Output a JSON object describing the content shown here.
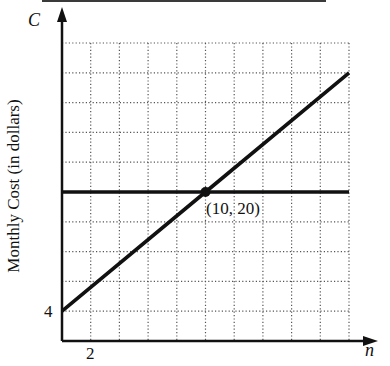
{
  "chart_data": {
    "type": "line",
    "title": "",
    "xlabel": "n",
    "ylabel": "Monthly Cost (in dollars)",
    "y_axis_letter": "C",
    "x_axis_letter": "n",
    "xlim": [
      0,
      20
    ],
    "ylim": [
      0,
      40
    ],
    "x_grid_step": 2,
    "y_grid_step": 4,
    "grid": true,
    "grid_style": "dotted",
    "x_tick_labels": [
      {
        "value": 2,
        "label": "2"
      }
    ],
    "y_tick_labels": [
      {
        "value": 4,
        "label": "4"
      }
    ],
    "series": [
      {
        "name": "increasing line",
        "equation": "C = 1.6n + 4",
        "x": [
          0,
          10,
          20
        ],
        "values": [
          4,
          20,
          36
        ]
      },
      {
        "name": "constant line",
        "equation": "C = 20",
        "x": [
          0,
          10,
          20
        ],
        "values": [
          20,
          20,
          20
        ]
      }
    ],
    "annotations": [
      {
        "type": "point",
        "x": 10,
        "y": 20,
        "label": "(10, 20)"
      }
    ],
    "legend": null
  },
  "labels": {
    "y_axis_title": "Monthly Cost (in dollars)",
    "y_axis_letter": "C",
    "x_axis_letter": "n",
    "x_tick": "2",
    "y_tick": "4",
    "intersection": "(10, 20)"
  },
  "colors": {
    "line": "#111111",
    "grid": "#555555",
    "axis": "#111111"
  }
}
